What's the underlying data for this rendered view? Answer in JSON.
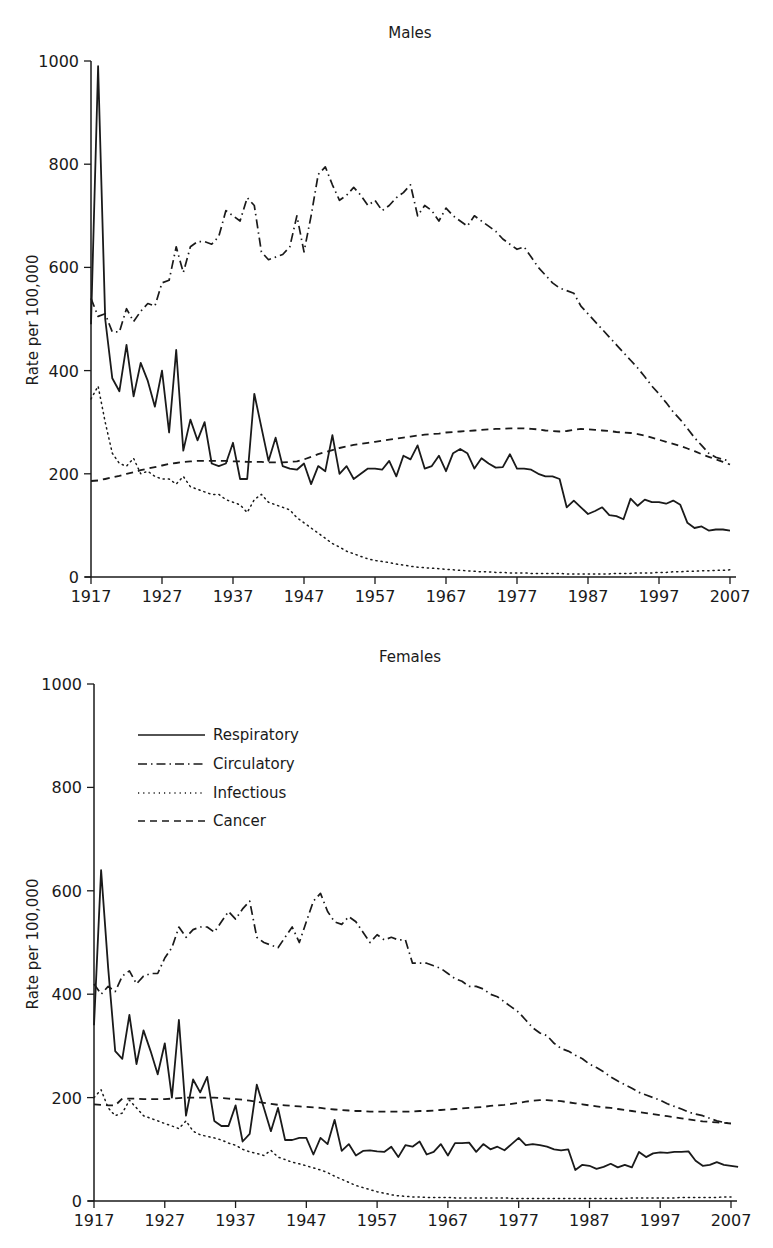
{
  "legend": {
    "entries": [
      {
        "label": "Respiratory",
        "style": "solid"
      },
      {
        "label": "Circulatory",
        "style": "dashdot"
      },
      {
        "label": "Infectious",
        "style": "dotted"
      },
      {
        "label": "Cancer",
        "style": "dashed"
      }
    ]
  },
  "chart_data": [
    {
      "type": "line",
      "title": "Males",
      "xlabel": "",
      "ylabel": "Rate per 100,000",
      "ylim": [
        0,
        1000
      ],
      "xlim": [
        1917,
        2007
      ],
      "yticks": [
        0,
        200,
        400,
        600,
        800,
        1000
      ],
      "xticks": [
        1917,
        1927,
        1937,
        1947,
        1957,
        1967,
        1977,
        1987,
        1997,
        2007
      ],
      "grid": false,
      "legend_position": "none",
      "x_start": 1917,
      "series": [
        {
          "name": "Respiratory",
          "style": "solid",
          "values": [
            490,
            990,
            500,
            385,
            360,
            450,
            350,
            415,
            380,
            330,
            400,
            280,
            440,
            245,
            305,
            265,
            300,
            220,
            215,
            220,
            260,
            190,
            190,
            355,
            290,
            225,
            270,
            215,
            210,
            208,
            220,
            180,
            215,
            205,
            275,
            200,
            215,
            190,
            200,
            210,
            210,
            208,
            225,
            195,
            235,
            228,
            255,
            210,
            215,
            235,
            205,
            240,
            248,
            240,
            210,
            230,
            220,
            212,
            213,
            238,
            210,
            210,
            208,
            200,
            195,
            195,
            190,
            135,
            148,
            135,
            122,
            128,
            135,
            120,
            118,
            112,
            152,
            138,
            150,
            145,
            145,
            142,
            148,
            140,
            105,
            95,
            98,
            90,
            92,
            92,
            90
          ]
        },
        {
          "name": "Circulatory",
          "style": "dashdot",
          "values": [
            540,
            505,
            510,
            475,
            475,
            520,
            495,
            515,
            530,
            525,
            570,
            575,
            640,
            590,
            640,
            650,
            650,
            645,
            660,
            710,
            700,
            690,
            735,
            720,
            630,
            615,
            620,
            625,
            640,
            700,
            630,
            700,
            780,
            795,
            760,
            730,
            740,
            755,
            740,
            720,
            730,
            710,
            720,
            735,
            745,
            760,
            700,
            720,
            710,
            690,
            715,
            700,
            690,
            680,
            700,
            690,
            680,
            670,
            655,
            645,
            635,
            640,
            620,
            600,
            585,
            570,
            560,
            555,
            550,
            525,
            510,
            495,
            480,
            465,
            450,
            435,
            420,
            405,
            388,
            370,
            355,
            338,
            320,
            305,
            288,
            270,
            255,
            240,
            232,
            228,
            225
          ]
        },
        {
          "name": "Infectious",
          "style": "dotted",
          "values": [
            345,
            370,
            300,
            240,
            220,
            215,
            230,
            200,
            205,
            195,
            190,
            190,
            180,
            195,
            175,
            170,
            165,
            160,
            160,
            150,
            145,
            140,
            125,
            150,
            160,
            145,
            140,
            135,
            130,
            115,
            105,
            95,
            85,
            75,
            65,
            58,
            50,
            45,
            40,
            35,
            32,
            30,
            28,
            25,
            23,
            21,
            19,
            18,
            17,
            16,
            15,
            14,
            13,
            12,
            11,
            10,
            10,
            9,
            9,
            8,
            8,
            8,
            7,
            7,
            7,
            7,
            7,
            6,
            6,
            6,
            6,
            6,
            6,
            6,
            7,
            7,
            7,
            8,
            8,
            8,
            9,
            9,
            10,
            10,
            11,
            11,
            12,
            12,
            13,
            13,
            14
          ]
        },
        {
          "name": "Cancer",
          "style": "dashed",
          "values": [
            186,
            187,
            190,
            193,
            196,
            200,
            203,
            207,
            210,
            213,
            216,
            219,
            221,
            223,
            224,
            225,
            225,
            225,
            225,
            225,
            224,
            224,
            223,
            223,
            223,
            222,
            222,
            222,
            223,
            224,
            228,
            233,
            238,
            242,
            246,
            250,
            253,
            256,
            258,
            260,
            262,
            264,
            266,
            268,
            270,
            272,
            274,
            276,
            277,
            278,
            280,
            281,
            282,
            283,
            284,
            285,
            286,
            287,
            287,
            288,
            288,
            288,
            287,
            286,
            284,
            283,
            282,
            283,
            285,
            287,
            286,
            285,
            284,
            283,
            281,
            280,
            279,
            277,
            274,
            270,
            266,
            262,
            258,
            254,
            249,
            244,
            238,
            233,
            228,
            223,
            218
          ]
        }
      ]
    },
    {
      "type": "line",
      "title": "Females",
      "xlabel": "",
      "ylabel": "Rate per 100,000",
      "ylim": [
        0,
        1000
      ],
      "xlim": [
        1917,
        2007
      ],
      "yticks": [
        0,
        200,
        400,
        600,
        800,
        1000
      ],
      "xticks": [
        1917,
        1927,
        1937,
        1947,
        1957,
        1967,
        1977,
        1987,
        1997,
        2007
      ],
      "grid": false,
      "legend_position": "upper left",
      "x_start": 1917,
      "series": [
        {
          "name": "Respiratory",
          "style": "solid",
          "values": [
            340,
            640,
            450,
            290,
            275,
            360,
            265,
            330,
            290,
            245,
            305,
            200,
            350,
            165,
            235,
            210,
            240,
            155,
            145,
            145,
            185,
            115,
            130,
            225,
            180,
            135,
            180,
            118,
            118,
            122,
            122,
            90,
            122,
            110,
            157,
            97,
            110,
            88,
            97,
            98,
            96,
            95,
            105,
            85,
            108,
            105,
            115,
            90,
            95,
            110,
            88,
            112,
            112,
            113,
            95,
            110,
            100,
            105,
            98,
            110,
            122,
            108,
            110,
            108,
            105,
            100,
            98,
            100,
            60,
            70,
            68,
            62,
            66,
            72,
            65,
            70,
            65,
            95,
            85,
            92,
            94,
            93,
            95,
            95,
            96,
            78,
            68,
            70,
            75,
            70,
            68,
            66
          ]
        },
        {
          "name": "Circulatory",
          "style": "dashdot",
          "values": [
            420,
            400,
            415,
            405,
            435,
            445,
            420,
            435,
            440,
            440,
            470,
            490,
            530,
            510,
            525,
            530,
            530,
            520,
            540,
            560,
            545,
            565,
            580,
            510,
            500,
            495,
            490,
            510,
            530,
            500,
            540,
            580,
            595,
            560,
            540,
            535,
            550,
            540,
            520,
            500,
            515,
            505,
            510,
            505,
            505,
            460,
            460,
            460,
            455,
            450,
            440,
            430,
            425,
            415,
            415,
            410,
            400,
            395,
            385,
            375,
            365,
            350,
            335,
            325,
            320,
            305,
            295,
            290,
            282,
            275,
            265,
            258,
            250,
            240,
            232,
            225,
            218,
            210,
            205,
            200,
            195,
            188,
            183,
            178,
            172,
            168,
            165,
            160,
            155,
            152,
            150
          ]
        },
        {
          "name": "Infectious",
          "style": "dotted",
          "values": [
            200,
            215,
            180,
            165,
            170,
            195,
            180,
            165,
            160,
            155,
            150,
            145,
            140,
            155,
            135,
            128,
            125,
            122,
            118,
            112,
            108,
            100,
            95,
            92,
            88,
            98,
            85,
            80,
            75,
            72,
            68,
            64,
            60,
            55,
            48,
            42,
            36,
            30,
            26,
            22,
            18,
            15,
            12,
            10,
            9,
            8,
            8,
            7,
            7,
            7,
            7,
            6,
            6,
            6,
            6,
            6,
            6,
            6,
            6,
            5,
            5,
            5,
            5,
            5,
            5,
            5,
            5,
            5,
            5,
            5,
            5,
            5,
            5,
            5,
            5,
            5,
            6,
            6,
            6,
            6,
            6,
            6,
            6,
            7,
            7,
            7,
            7,
            7,
            7,
            8,
            8
          ]
        },
        {
          "name": "Cancer",
          "style": "dashed",
          "values": [
            187,
            186,
            185,
            185,
            198,
            198,
            198,
            197,
            197,
            197,
            197,
            198,
            199,
            200,
            200,
            200,
            200,
            200,
            199,
            198,
            197,
            196,
            194,
            192,
            190,
            188,
            186,
            185,
            184,
            183,
            182,
            181,
            180,
            178,
            177,
            176,
            175,
            174,
            174,
            173,
            173,
            173,
            173,
            173,
            173,
            173,
            174,
            174,
            175,
            176,
            177,
            178,
            179,
            180,
            181,
            182,
            184,
            185,
            186,
            188,
            190,
            192,
            194,
            195,
            195,
            194,
            193,
            191,
            189,
            187,
            185,
            183,
            181,
            180,
            178,
            176,
            174,
            172,
            170,
            168,
            166,
            164,
            162,
            160,
            158,
            156,
            154,
            153,
            152,
            151,
            150
          ]
        }
      ]
    }
  ],
  "charts": [
    {
      "title": "Males",
      "ylabel": "Rate per 100,000",
      "yticks": [
        "0",
        "200",
        "400",
        "600",
        "800",
        "1000"
      ],
      "xticks": [
        "1917",
        "1927",
        "1937",
        "1947",
        "1957",
        "1967",
        "1977",
        "1987",
        "1997",
        "2007"
      ]
    },
    {
      "title": "Females",
      "ylabel": "Rate per 100,000",
      "yticks": [
        "0",
        "200",
        "400",
        "600",
        "800",
        "1000"
      ],
      "xticks": [
        "1917",
        "1927",
        "1937",
        "1947",
        "1957",
        "1967",
        "1977",
        "1987",
        "1997",
        "2007"
      ]
    }
  ]
}
